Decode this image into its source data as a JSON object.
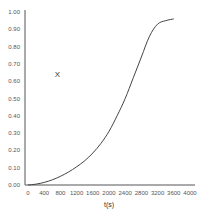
{
  "chart_data": {
    "type": "line",
    "title": "",
    "xlabel": "t(s)",
    "ylabel": "",
    "xlim": [
      0,
      4000
    ],
    "ylim": [
      0,
      1.0
    ],
    "grid": false,
    "legend": null,
    "x_ticks": [
      "0",
      "400",
      "800",
      "1200",
      "1600",
      "2000",
      "2400",
      "2800",
      "3200",
      "3600",
      "4000"
    ],
    "y_ticks": [
      "0.00",
      "0.10",
      "0.20",
      "0.30",
      "0.40",
      "0.50",
      "0.60",
      "0.70",
      "0.80",
      "0.90",
      "1.00"
    ],
    "annotations": [
      {
        "text": "X",
        "x": 700,
        "y": 0.64
      }
    ],
    "series": [
      {
        "name": "curve",
        "color": "#444444",
        "x": [
          0,
          200,
          400,
          600,
          800,
          1000,
          1200,
          1400,
          1600,
          1800,
          2000,
          2200,
          2400,
          2600,
          2800,
          3000,
          3200,
          3400,
          3600
        ],
        "y": [
          0.0,
          0.005,
          0.015,
          0.03,
          0.05,
          0.075,
          0.105,
          0.14,
          0.185,
          0.24,
          0.31,
          0.4,
          0.5,
          0.62,
          0.74,
          0.86,
          0.93,
          0.95,
          0.96
        ]
      }
    ]
  }
}
